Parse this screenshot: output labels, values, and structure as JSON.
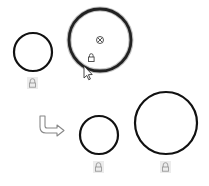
{
  "canvas": {
    "width": 209,
    "height": 186,
    "background": "#ffffff"
  },
  "colors": {
    "stroke": "#111111",
    "lock_bg": "#ececec",
    "lock_icon": "#9a9a9a",
    "arrow": "#888888"
  },
  "shapes": [
    {
      "id": "circle-small-before",
      "cx": 33,
      "cy": 52,
      "r": 19,
      "stroke_width": 2.2,
      "selected": false,
      "lock": {
        "x": 27,
        "y": 77
      }
    },
    {
      "id": "circle-large-selected",
      "cx": 100,
      "cy": 40,
      "r": 31,
      "stroke_width": 3.2,
      "selected": true,
      "center_marker": "circled-x-icon",
      "lock": {
        "x": 88,
        "y": 55
      }
    },
    {
      "id": "circle-small-after",
      "cx": 99,
      "cy": 135,
      "r": 19,
      "stroke_width": 2.2,
      "selected": false,
      "lock": {
        "x": 93,
        "y": 162
      }
    },
    {
      "id": "circle-large-after",
      "cx": 166,
      "cy": 123,
      "r": 31,
      "stroke_width": 2.2,
      "selected": false,
      "lock": {
        "x": 160,
        "y": 162
      }
    }
  ],
  "transition_arrow": {
    "icon": "bent-arrow-right-icon"
  },
  "cursor": {
    "icon": "mouse-pointer-icon",
    "x": 84,
    "y": 66
  }
}
